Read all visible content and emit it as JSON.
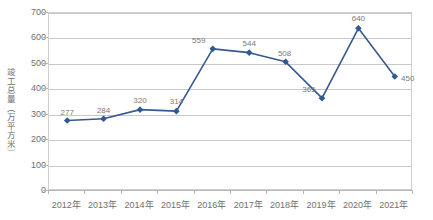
{
  "chart_data": {
    "type": "line",
    "title": "",
    "xlabel": "",
    "ylabel": "竣工总量（万平方米）",
    "categories": [
      "2012年",
      "2013年",
      "2014年",
      "2015年",
      "2016年",
      "2017年",
      "2018年",
      "2019年",
      "2020年",
      "2021年"
    ],
    "values": [
      277,
      284,
      320,
      314,
      559,
      544,
      508,
      365,
      640,
      450
    ],
    "point_labels": [
      "277",
      "284",
      "320",
      "314",
      "559",
      "544",
      "508",
      "365",
      "640",
      "450"
    ],
    "ylim": [
      0,
      700
    ],
    "yticks": [
      0,
      100,
      200,
      300,
      400,
      500,
      600,
      700
    ],
    "ytick_labels": [
      "0",
      "100",
      "200",
      "300",
      "400",
      "500",
      "600",
      "700"
    ],
    "grid": true,
    "legend": "none",
    "series": [
      {
        "name": "竣工总量",
        "values": [
          277,
          284,
          320,
          314,
          559,
          544,
          508,
          365,
          640,
          450
        ],
        "color": "#36598F",
        "marker": "diamond",
        "marker_color": "#2E5A94"
      }
    ]
  },
  "style": {
    "line_color": "#36598F",
    "marker_color": "#2E5A94",
    "grid_color": "#c8c8c8",
    "border_color": "#cfcfcf",
    "axis_color": "#b5b5b5",
    "tick_text_color": "#6f6f6f",
    "data_label_color": "#7a7a7a",
    "background": "#ffffff"
  }
}
